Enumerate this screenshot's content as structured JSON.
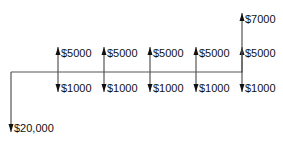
{
  "diagram": {
    "type": "cash-flow-diagram",
    "line_color": "#555555",
    "arrow_color": "#111111",
    "timeline": {
      "y": 72,
      "x_start": 11,
      "x_end": 243
    },
    "flows": [
      {
        "period": 0,
        "x": 11,
        "direction": "down",
        "amount": "$20,000",
        "tip_y": 132
      },
      {
        "period": 1,
        "x": 58,
        "direction": "up",
        "amount": "$5000",
        "tip_y": 47
      },
      {
        "period": 1,
        "x": 58,
        "direction": "down",
        "amount": "$1000",
        "tip_y": 92
      },
      {
        "period": 2,
        "x": 104,
        "direction": "up",
        "amount": "$5000",
        "tip_y": 47
      },
      {
        "period": 2,
        "x": 104,
        "direction": "down",
        "amount": "$1000",
        "tip_y": 92
      },
      {
        "period": 3,
        "x": 150,
        "direction": "up",
        "amount": "$5000",
        "tip_y": 47
      },
      {
        "period": 3,
        "x": 150,
        "direction": "down",
        "amount": "$1000",
        "tip_y": 92
      },
      {
        "period": 4,
        "x": 196,
        "direction": "up",
        "amount": "$5000",
        "tip_y": 47
      },
      {
        "period": 4,
        "x": 196,
        "direction": "down",
        "amount": "$1000",
        "tip_y": 92
      },
      {
        "period": 5,
        "x": 242,
        "direction": "up",
        "amount": "$5000",
        "tip_y": 47
      },
      {
        "period": 5,
        "x": 242,
        "direction": "up",
        "amount": "$7000",
        "tip_y": 13
      },
      {
        "period": 5,
        "x": 242,
        "direction": "down",
        "amount": "$1000",
        "tip_y": 92
      }
    ]
  }
}
